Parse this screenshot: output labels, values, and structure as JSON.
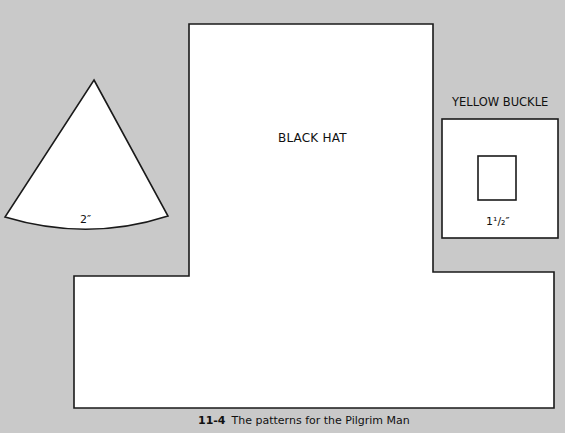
{
  "figure": {
    "caption_number": "11-4",
    "caption_text": "The patterns for the Pilgrim Man"
  },
  "patterns": {
    "hat": {
      "label": "BLACK HAT"
    },
    "cone": {
      "dimension": "2″"
    },
    "buckle": {
      "title": "YELLOW BUCKLE",
      "dimension": "1¹/₂″"
    }
  },
  "colors": {
    "background": "#c9c9c9",
    "shape_fill": "#ffffff",
    "outline": "#1a1a1a"
  }
}
